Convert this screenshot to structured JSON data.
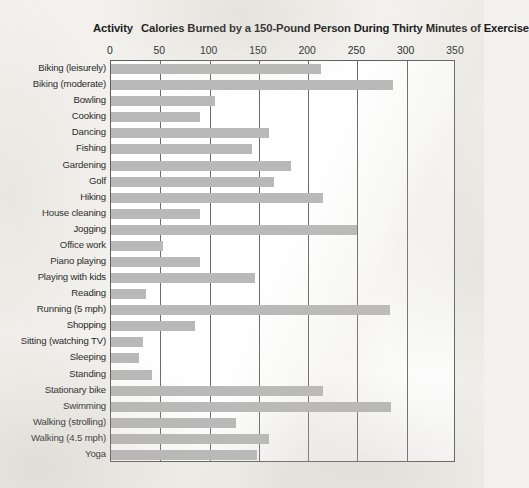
{
  "heading": {
    "activity_label": "Activity",
    "title": "Calories Burned by a 150-Pound Person During Thirty Minutes of Exercise"
  },
  "chart_data": {
    "type": "bar",
    "orientation": "horizontal",
    "title": "Calories Burned by a 150-Pound Person During Thirty Minutes of Exercise",
    "xlabel": "",
    "ylabel": "Activity",
    "xlim": [
      0,
      350
    ],
    "xticks": [
      0,
      50,
      100,
      150,
      200,
      250,
      300,
      350
    ],
    "xtick_labels": [
      "0",
      "50",
      "100",
      "150",
      "200",
      "250",
      "300",
      "350"
    ],
    "grid": true,
    "grid_axis": "x",
    "legend": false,
    "bar_color": "#b9b9b9",
    "plot_background": "#ffffff",
    "page_background": "#f2f1ed",
    "categories": [
      "Biking (leisurely)",
      "Biking (moderate)",
      "Bowling",
      "Cooking",
      "Dancing",
      "Fishing",
      "Gardening",
      "Golf",
      "Hiking",
      "House cleaning",
      "Jogging",
      "Office work",
      "Piano playing",
      "Playing with kids",
      "Reading",
      "Running (5 mph)",
      "Shopping",
      "Sitting (watching TV)",
      "Sleeping",
      "Standing",
      "Stationary bike",
      "Swimming",
      "Walking (strolling)",
      "Walking (4.5 mph)",
      "Yoga"
    ],
    "values": [
      213,
      286,
      106,
      90,
      160,
      143,
      183,
      165,
      215,
      90,
      250,
      53,
      90,
      146,
      35,
      283,
      85,
      32,
      28,
      42,
      215,
      284,
      127,
      160,
      148
    ]
  }
}
